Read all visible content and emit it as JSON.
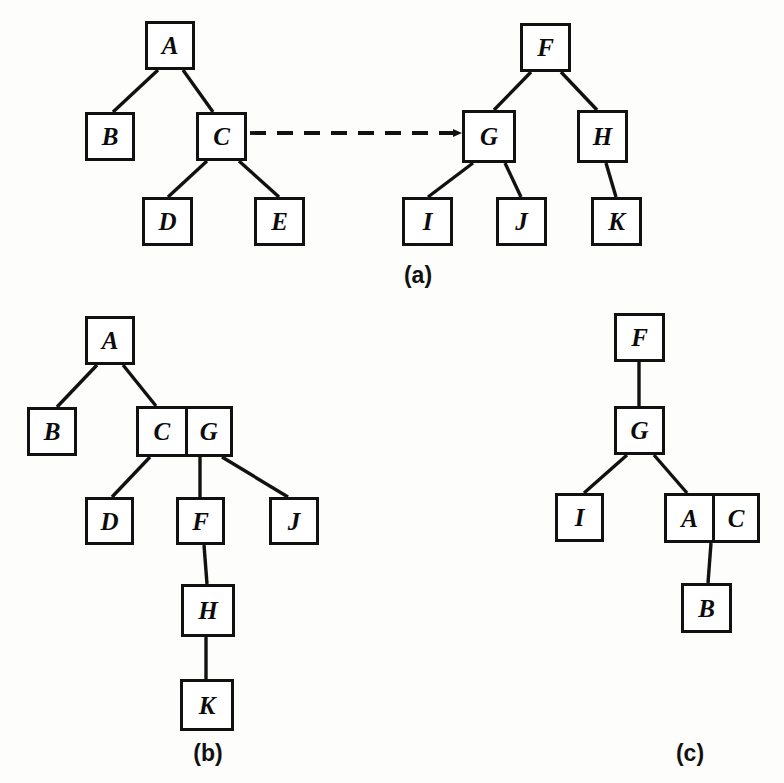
{
  "figure": {
    "background_color": "#fdfdfb",
    "stroke_color": "#111111",
    "node_fill": "#ffffff",
    "width": 784,
    "height": 783
  },
  "panels": [
    {
      "id": "a",
      "label": "(a)",
      "label_x": 418,
      "label_y": 262,
      "description": "two separate trees joined by a dashed arrow from C to G"
    },
    {
      "id": "b",
      "label": "(b)",
      "label_x": 208,
      "label_y": 740,
      "description": "merged tree with combined C G node"
    },
    {
      "id": "c",
      "label": "(c)",
      "label_x": 690,
      "label_y": 740,
      "description": "merged tree with combined A C node"
    }
  ],
  "nodes": {
    "a": [
      {
        "key": "a-A",
        "label": "A",
        "x": 145,
        "y": 21,
        "w": 50,
        "h": 49
      },
      {
        "key": "a-B",
        "label": "B",
        "x": 85,
        "y": 112,
        "w": 50,
        "h": 49
      },
      {
        "key": "a-C",
        "label": "C",
        "x": 196,
        "y": 112,
        "w": 51,
        "h": 49
      },
      {
        "key": "a-D",
        "label": "D",
        "x": 142,
        "y": 197,
        "w": 51,
        "h": 49
      },
      {
        "key": "a-E",
        "label": "E",
        "x": 254,
        "y": 197,
        "w": 51,
        "h": 49
      },
      {
        "key": "a-F",
        "label": "F",
        "x": 520,
        "y": 23,
        "w": 51,
        "h": 49
      },
      {
        "key": "a-G",
        "label": "G",
        "x": 462,
        "y": 110,
        "w": 54,
        "h": 53
      },
      {
        "key": "a-H",
        "label": "H",
        "x": 577,
        "y": 110,
        "w": 51,
        "h": 53
      },
      {
        "key": "a-I",
        "label": "I",
        "x": 402,
        "y": 197,
        "w": 51,
        "h": 49
      },
      {
        "key": "a-J",
        "label": "J",
        "x": 496,
        "y": 197,
        "w": 51,
        "h": 49
      },
      {
        "key": "a-K",
        "label": "K",
        "x": 591,
        "y": 197,
        "w": 51,
        "h": 49
      }
    ],
    "b": [
      {
        "key": "b-A",
        "label": "A",
        "x": 85,
        "y": 316,
        "w": 50,
        "h": 49
      },
      {
        "key": "b-B",
        "label": "B",
        "x": 27,
        "y": 407,
        "w": 50,
        "h": 49
      },
      {
        "key": "b-D",
        "label": "D",
        "x": 85,
        "y": 497,
        "w": 49,
        "h": 48
      },
      {
        "key": "b-F",
        "label": "F",
        "x": 176,
        "y": 497,
        "w": 49,
        "h": 48
      },
      {
        "key": "b-J",
        "label": "J",
        "x": 269,
        "y": 497,
        "w": 50,
        "h": 48
      },
      {
        "key": "b-H",
        "label": "H",
        "x": 181,
        "y": 584,
        "w": 54,
        "h": 53
      },
      {
        "key": "b-K",
        "label": "K",
        "x": 180,
        "y": 679,
        "w": 54,
        "h": 52
      }
    ],
    "b_dual": [
      {
        "key": "b-CG",
        "left": "C",
        "right": "G",
        "x": 136,
        "y": 406,
        "w": 97,
        "h": 51
      }
    ],
    "c": [
      {
        "key": "c-F",
        "label": "F",
        "x": 614,
        "y": 313,
        "w": 51,
        "h": 49
      },
      {
        "key": "c-G",
        "label": "G",
        "x": 614,
        "y": 406,
        "w": 51,
        "h": 49
      },
      {
        "key": "c-I",
        "label": "I",
        "x": 555,
        "y": 493,
        "w": 49,
        "h": 49
      },
      {
        "key": "c-B",
        "label": "B",
        "x": 681,
        "y": 583,
        "w": 51,
        "h": 50
      }
    ],
    "c_dual": [
      {
        "key": "c-AC",
        "left": "A",
        "right": "C",
        "x": 664,
        "y": 493,
        "w": 96,
        "h": 50
      }
    ]
  },
  "edges": {
    "a": [
      {
        "from": "A",
        "to": "B",
        "x1": 158,
        "y1": 70,
        "x2": 113,
        "y2": 112
      },
      {
        "from": "A",
        "to": "C",
        "x1": 183,
        "y1": 70,
        "x2": 213,
        "y2": 112
      },
      {
        "from": "C",
        "to": "D",
        "x1": 207,
        "y1": 161,
        "x2": 168,
        "y2": 197
      },
      {
        "from": "C",
        "to": "E",
        "x1": 239,
        "y1": 161,
        "x2": 279,
        "y2": 197
      },
      {
        "from": "F",
        "to": "G",
        "x1": 531,
        "y1": 72,
        "x2": 494,
        "y2": 110
      },
      {
        "from": "F",
        "to": "H",
        "x1": 561,
        "y1": 72,
        "x2": 597,
        "y2": 110
      },
      {
        "from": "G",
        "to": "I",
        "x1": 473,
        "y1": 163,
        "x2": 428,
        "y2": 197
      },
      {
        "from": "G",
        "to": "J",
        "x1": 505,
        "y1": 163,
        "x2": 521,
        "y2": 197
      },
      {
        "from": "H",
        "to": "K",
        "x1": 606,
        "y1": 163,
        "x2": 616,
        "y2": 197
      }
    ],
    "a_arrow": {
      "from": "C",
      "to": "G",
      "x1": 250,
      "y1": 133,
      "x2": 461,
      "y2": 133,
      "style": "dashed-with-arrowhead"
    },
    "b": [
      {
        "from": "A",
        "to": "B",
        "x1": 97,
        "y1": 365,
        "x2": 57,
        "y2": 407
      },
      {
        "from": "A",
        "to": "CG",
        "x1": 123,
        "y1": 365,
        "x2": 156,
        "y2": 406
      },
      {
        "from": "CG",
        "to": "D",
        "x1": 150,
        "y1": 457,
        "x2": 112,
        "y2": 497
      },
      {
        "from": "CG",
        "to": "F",
        "x1": 200,
        "y1": 457,
        "x2": 200,
        "y2": 497
      },
      {
        "from": "CG",
        "to": "J",
        "x1": 222,
        "y1": 457,
        "x2": 288,
        "y2": 497
      },
      {
        "from": "F",
        "to": "H",
        "x1": 204,
        "y1": 545,
        "x2": 207,
        "y2": 584
      },
      {
        "from": "H",
        "to": "K",
        "x1": 206,
        "y1": 637,
        "x2": 206,
        "y2": 679
      }
    ],
    "c": [
      {
        "from": "F",
        "to": "G",
        "x1": 639,
        "y1": 362,
        "x2": 639,
        "y2": 406
      },
      {
        "from": "G",
        "to": "I",
        "x1": 627,
        "y1": 455,
        "x2": 584,
        "y2": 493
      },
      {
        "from": "G",
        "to": "AC",
        "x1": 654,
        "y1": 455,
        "x2": 687,
        "y2": 493
      },
      {
        "from": "AC",
        "to": "B",
        "x1": 711,
        "y1": 543,
        "x2": 708,
        "y2": 583
      }
    ]
  }
}
